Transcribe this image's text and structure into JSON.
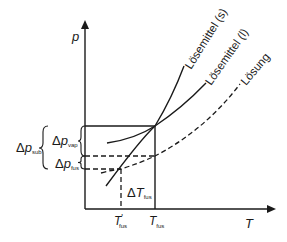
{
  "diagram": {
    "type": "phase-diagram",
    "axes": {
      "y_label": "p",
      "x_label": "T"
    },
    "curves": [
      {
        "name": "Lösemittel (s)",
        "style": "solid"
      },
      {
        "name": "Lösemittel (l)",
        "style": "solid"
      },
      {
        "name": "Lösung",
        "style": "dashed"
      }
    ],
    "labels": {
      "curve_s": "Lösemittel (s)",
      "curve_l": "Lösemittel (l)",
      "curve_solution": "Lösung",
      "delta": "Δ",
      "p": "p",
      "T": "T",
      "sub_sub": "sub",
      "sub_vap": "vap",
      "sub_fus": "fus",
      "prime": "'"
    },
    "annotations": {
      "delta_p_sub": {
        "symbol": "Δp",
        "subscript": "sub"
      },
      "delta_p_vap": {
        "symbol": "Δp",
        "subscript": "vap"
      },
      "delta_p_fus": {
        "symbol": "Δp",
        "subscript": "fus"
      },
      "delta_T_fus": {
        "symbol": "ΔT",
        "subscript": "fus"
      },
      "T_fus_prime": {
        "symbol": "T'",
        "subscript": "fus"
      },
      "T_fus": {
        "symbol": "T",
        "subscript": "fus"
      }
    },
    "colors": {
      "line": "#1a1a1a",
      "background": "#ffffff"
    }
  }
}
